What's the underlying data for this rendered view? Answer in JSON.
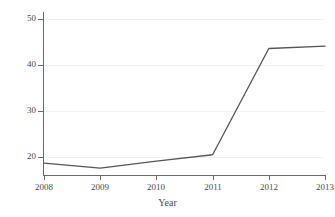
{
  "chart_data": {
    "type": "line",
    "title": "",
    "xlabel": "Year",
    "ylabel": "Percent",
    "x": [
      2008,
      2009,
      2010,
      2011,
      2012,
      2013
    ],
    "categories": [
      "2008",
      "2009",
      "2010",
      "2011",
      "2012",
      "2013"
    ],
    "values": [
      18.6,
      17.5,
      19.0,
      20.4,
      43.5,
      44.0
    ],
    "series": [
      {
        "name": "Percent",
        "values": [
          18.6,
          17.5,
          19.0,
          20.4,
          43.5,
          44.0
        ]
      }
    ],
    "xlim": [
      2008,
      2013
    ],
    "ylim": [
      16.0,
      51.0
    ],
    "yticks": [
      20,
      30,
      40,
      50
    ],
    "ytick_labels": [
      "20",
      "30",
      "40",
      "50"
    ],
    "xticks": [
      2008,
      2009,
      2010,
      2011,
      2012,
      2013
    ],
    "xtick_labels": [
      "2008",
      "2009",
      "2010",
      "2011",
      "2012",
      "2013"
    ],
    "grid": true,
    "grid_axis": "y",
    "legend": false,
    "legend_position": "none",
    "line_color": "#555555",
    "grid_color": "#f1f1f1",
    "axis_color": "#6b6b6b",
    "background_color": "#ffffff",
    "annotations": []
  }
}
